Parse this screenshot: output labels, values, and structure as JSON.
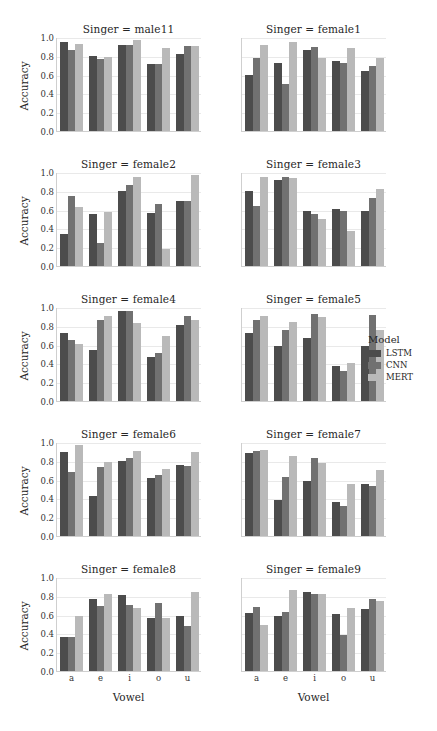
{
  "chart_data": {
    "type": "bar",
    "title": "",
    "subtitle": "",
    "xlabel": "Vowel",
    "ylabel": "Accuracy",
    "categories": [
      "a",
      "e",
      "i",
      "o",
      "u"
    ],
    "ylim": [
      0.0,
      1.0
    ],
    "yticks": [
      "0.0",
      "0.2",
      "0.4",
      "0.6",
      "0.8",
      "1.0"
    ],
    "ytick_values": [
      0.0,
      0.2,
      0.4,
      0.6,
      0.8,
      1.0
    ],
    "grid": true,
    "legend": {
      "title": "Model",
      "position": "right",
      "entries": [
        {
          "name": "LSTM",
          "color": "#4c4c4c"
        },
        {
          "name": "CNN",
          "color": "#717171"
        },
        {
          "name": "MERT",
          "color": "#b9b9b9"
        }
      ]
    },
    "facet_variable": "Singer",
    "facet_layout": {
      "rows": 5,
      "cols": 2
    },
    "facets": [
      {
        "title": "Singer = male11",
        "facet_value": "male11",
        "series": [
          {
            "name": "LSTM",
            "values": [
              0.95,
              0.8,
              0.91,
              0.71,
              0.82
            ]
          },
          {
            "name": "CNN",
            "values": [
              0.86,
              0.77,
              0.91,
              0.71,
              0.9
            ]
          },
          {
            "name": "MERT",
            "values": [
              0.93,
              0.79,
              0.97,
              0.88,
              0.9
            ]
          }
        ]
      },
      {
        "title": "Singer = female1",
        "facet_value": "female1",
        "series": [
          {
            "name": "LSTM",
            "values": [
              0.6,
              0.72,
              0.86,
              0.75,
              0.64
            ]
          },
          {
            "name": "CNN",
            "values": [
              0.78,
              0.5,
              0.89,
              0.72,
              0.69
            ]
          },
          {
            "name": "MERT",
            "values": [
              0.92,
              0.95,
              0.78,
              0.88,
              0.78
            ]
          }
        ]
      },
      {
        "title": "Singer = female2",
        "facet_value": "female2",
        "series": [
          {
            "name": "LSTM",
            "values": [
              0.34,
              0.55,
              0.8,
              0.56,
              0.69
            ]
          },
          {
            "name": "CNN",
            "values": [
              0.74,
              0.25,
              0.86,
              0.66,
              0.69
            ]
          },
          {
            "name": "MERT",
            "values": [
              0.63,
              0.57,
              0.95,
              0.18,
              0.97
            ]
          }
        ]
      },
      {
        "title": "Singer = female3",
        "facet_value": "female3",
        "series": [
          {
            "name": "LSTM",
            "values": [
              0.8,
              0.92,
              0.58,
              0.61,
              0.59
            ]
          },
          {
            "name": "CNN",
            "values": [
              0.64,
              0.95,
              0.55,
              0.58,
              0.72
            ]
          },
          {
            "name": "MERT",
            "values": [
              0.95,
              0.94,
              0.5,
              0.37,
              0.82
            ]
          }
        ]
      },
      {
        "title": "Singer = female4",
        "facet_value": "female4",
        "series": [
          {
            "name": "LSTM",
            "values": [
              0.72,
              0.54,
              0.96,
              0.47,
              0.81
            ]
          },
          {
            "name": "CNN",
            "values": [
              0.65,
              0.86,
              0.96,
              0.51,
              0.9
            ]
          },
          {
            "name": "MERT",
            "values": [
              0.61,
              0.9,
              0.83,
              0.69,
              0.86
            ]
          }
        ]
      },
      {
        "title": "Singer = female5",
        "facet_value": "female5",
        "series": [
          {
            "name": "LSTM",
            "values": [
              0.72,
              0.58,
              0.67,
              0.37,
              0.59
            ]
          },
          {
            "name": "CNN",
            "values": [
              0.86,
              0.76,
              0.93,
              0.32,
              0.92
            ]
          },
          {
            "name": "MERT",
            "values": [
              0.9,
              0.84,
              0.89,
              0.4,
              0.76
            ]
          }
        ]
      },
      {
        "title": "Singer = female6",
        "facet_value": "female6",
        "series": [
          {
            "name": "LSTM",
            "values": [
              0.89,
              0.43,
              0.8,
              0.62,
              0.76
            ]
          },
          {
            "name": "CNN",
            "values": [
              0.68,
              0.73,
              0.83,
              0.65,
              0.74
            ]
          },
          {
            "name": "MERT",
            "values": [
              0.97,
              0.79,
              0.9,
              0.71,
              0.89
            ]
          }
        ]
      },
      {
        "title": "Singer = female7",
        "facet_value": "female7",
        "series": [
          {
            "name": "LSTM",
            "values": [
              0.88,
              0.38,
              0.58,
              0.36,
              0.55
            ]
          },
          {
            "name": "CNN",
            "values": [
              0.9,
              0.63,
              0.83,
              0.32,
              0.53
            ]
          },
          {
            "name": "MERT",
            "values": [
              0.92,
              0.85,
              0.78,
              0.55,
              0.7
            ]
          }
        ]
      },
      {
        "title": "Singer = female8",
        "facet_value": "female8",
        "series": [
          {
            "name": "LSTM",
            "values": [
              0.36,
              0.77,
              0.81,
              0.56,
              0.58
            ]
          },
          {
            "name": "CNN",
            "values": [
              0.36,
              0.69,
              0.7,
              0.72,
              0.48
            ]
          },
          {
            "name": "MERT",
            "values": [
              0.59,
              0.82,
              0.67,
              0.56,
              0.84
            ]
          }
        ]
      },
      {
        "title": "Singer = female9",
        "facet_value": "female9",
        "series": [
          {
            "name": "LSTM",
            "values": [
              0.62,
              0.58,
              0.84,
              0.61,
              0.66
            ]
          },
          {
            "name": "CNN",
            "values": [
              0.68,
              0.63,
              0.82,
              0.38,
              0.77
            ]
          },
          {
            "name": "MERT",
            "values": [
              0.49,
              0.86,
              0.82,
              0.67,
              0.75
            ]
          }
        ]
      }
    ]
  }
}
